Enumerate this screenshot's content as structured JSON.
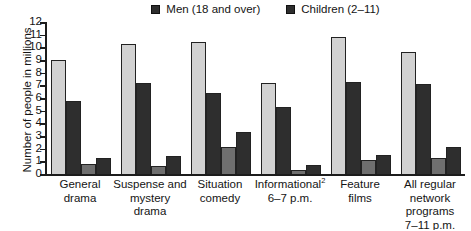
{
  "chart_data": {
    "type": "bar",
    "title": "",
    "subtitle": "",
    "xlabel": "",
    "ylabel": "Number of people in millions",
    "ylim": [
      0,
      12
    ],
    "yticks": [
      0,
      1,
      2,
      3,
      4,
      5,
      6,
      7,
      8,
      9,
      10,
      11,
      12
    ],
    "grid": false,
    "legend_position": "top-center",
    "legend_note": "Legend is cropped in the source image; only two of the four plotted series are labeled.",
    "categories": [
      "General drama",
      "Suspense and mystery drama",
      "Situation comedy",
      "Informational² 6–7 p.m.",
      "Feature films",
      "All regular network programs 7–11 p.m."
    ],
    "series": [
      {
        "name": "Women (18 and over)",
        "color": "#d2d2d2",
        "labeled_in_legend": false,
        "values": [
          9.0,
          10.3,
          10.4,
          7.2,
          10.8,
          9.6
        ]
      },
      {
        "name": "Men (18 and over)",
        "color": "#2e2e2e",
        "labeled_in_legend": true,
        "values": [
          5.8,
          7.2,
          6.4,
          5.3,
          7.3,
          7.1
        ]
      },
      {
        "name": "Teens (12–17)",
        "color": "#6f6f6f",
        "labeled_in_legend": false,
        "values": [
          0.8,
          0.6,
          2.1,
          0.35,
          1.1,
          1.25
        ]
      },
      {
        "name": "Children (2–11)",
        "color": "#2e2e2e",
        "labeled_in_legend": true,
        "values": [
          1.3,
          1.4,
          3.3,
          0.7,
          1.5,
          2.1
        ]
      }
    ]
  },
  "legend": {
    "items": [
      {
        "label": "Men (18 and over)",
        "color": "#2e2e2e"
      },
      {
        "label": "Children (2–11)",
        "color": "#2e2e2e"
      }
    ]
  },
  "axis": {
    "y_title": "Number of people in millions",
    "y_ticks": [
      "12",
      "11",
      "10",
      "9",
      "8",
      "7",
      "6",
      "5",
      "4",
      "3",
      "2",
      "1",
      "0"
    ]
  },
  "x_categories": [
    {
      "lines": [
        "General",
        "drama"
      ]
    },
    {
      "lines": [
        "Suspense and",
        "mystery",
        "drama"
      ]
    },
    {
      "lines": [
        "Situation",
        "comedy"
      ]
    },
    {
      "lines": [
        "Informational²",
        "6–7 p.m."
      ]
    },
    {
      "lines": [
        "Feature",
        "films"
      ]
    },
    {
      "lines": [
        "All regular",
        "network",
        "programs",
        "7–11 p.m."
      ]
    }
  ]
}
